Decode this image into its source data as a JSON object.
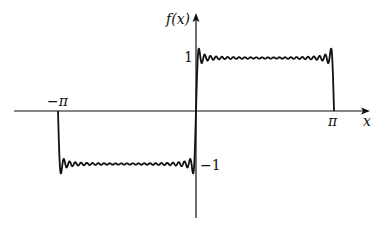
{
  "chart_data": {
    "type": "line",
    "title": "",
    "xlabel": "x",
    "ylabel": "f(x)",
    "x_ticks": [
      {
        "value": -3.14159,
        "label": "−π"
      },
      {
        "value": 3.14159,
        "label": "π"
      }
    ],
    "y_ticks": [
      {
        "value": 1,
        "label": "1"
      },
      {
        "value": -1,
        "label": "−1"
      }
    ],
    "xlim": [
      -4.9,
      5.4
    ],
    "ylim": [
      -2.0,
      1.7
    ],
    "grid": false,
    "legend": null,
    "series": [
      {
        "name": "Fourier partial sum (Gibbs ringing)",
        "x_range": [
          -3.14159,
          3.14159
        ],
        "levels": {
          "positive": 1,
          "negative": -1
        },
        "overshoot": 1.18,
        "ripple_count_per_half": 11
      }
    ]
  },
  "labels": {
    "ylabel": "f(x)",
    "xlabel": "x",
    "neg_pi": "−π",
    "pi": "π",
    "one": "1",
    "neg_one": "−1"
  }
}
